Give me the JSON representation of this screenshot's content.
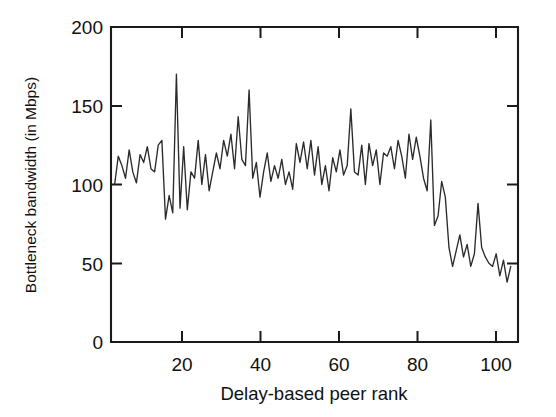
{
  "figure": {
    "background_color": "#ffffff",
    "line_color": "#2b2b2b",
    "axis_color": "#1a1a1a"
  },
  "chart_data": {
    "type": "line",
    "title": "",
    "xlabel": "Delay-based peer rank",
    "ylabel": "Bottleneck bandwidth (in Mbps)",
    "xlim": [
      0,
      112
    ],
    "ylim": [
      0,
      200
    ],
    "xticks": [
      20,
      40,
      60,
      80,
      100
    ],
    "yticks": [
      0,
      50,
      100,
      150,
      200
    ],
    "xtick_labels": [
      "20",
      "40",
      "60",
      "80",
      "100"
    ],
    "ytick_labels": [
      "0",
      "50",
      "100",
      "150",
      "200"
    ],
    "grid": false,
    "legend": false,
    "legend_position": "none",
    "series": [
      {
        "name": "Bottleneck bandwidth",
        "x": [
          1,
          2,
          3,
          4,
          5,
          6,
          7,
          8,
          9,
          10,
          11,
          12,
          13,
          14,
          15,
          16,
          17,
          18,
          19,
          20,
          21,
          22,
          23,
          24,
          25,
          26,
          27,
          28,
          29,
          30,
          31,
          32,
          33,
          34,
          35,
          36,
          37,
          38,
          39,
          40,
          41,
          42,
          43,
          44,
          45,
          46,
          47,
          48,
          49,
          50,
          51,
          52,
          53,
          54,
          55,
          56,
          57,
          58,
          59,
          60,
          61,
          62,
          63,
          64,
          65,
          66,
          67,
          68,
          69,
          70,
          71,
          72,
          73,
          74,
          75,
          76,
          77,
          78,
          79,
          80,
          81,
          82,
          83,
          84,
          85,
          86,
          87,
          88,
          89,
          90,
          91,
          92,
          93,
          94,
          95,
          96,
          97,
          98,
          99,
          100,
          101,
          102,
          103,
          104,
          105,
          106,
          107,
          108,
          109,
          110
        ],
        "values": [
          100,
          118,
          112,
          104,
          122,
          108,
          101,
          119,
          114,
          124,
          110,
          108,
          125,
          128,
          78,
          93,
          82,
          170,
          85,
          124,
          84,
          108,
          104,
          128,
          100,
          119,
          96,
          108,
          120,
          110,
          128,
          118,
          132,
          110,
          143,
          116,
          112,
          160,
          104,
          114,
          92,
          108,
          120,
          102,
          112,
          104,
          116,
          100,
          108,
          97,
          126,
          114,
          127,
          110,
          128,
          106,
          124,
          100,
          112,
          96,
          117,
          108,
          122,
          106,
          112,
          148,
          108,
          106,
          125,
          100,
          126,
          112,
          122,
          100,
          120,
          118,
          124,
          110,
          128,
          118,
          104,
          132,
          116,
          130,
          118,
          104,
          96,
          141,
          74,
          80,
          102,
          92,
          60,
          48,
          58,
          68,
          54,
          62,
          48,
          56,
          88,
          60,
          54,
          50,
          48,
          56,
          42,
          52,
          38,
          48
        ]
      }
    ]
  },
  "axes": {
    "ytitle": "Bottleneck bandwidth (in Mbps)",
    "xtitle": "Delay-based peer rank"
  }
}
